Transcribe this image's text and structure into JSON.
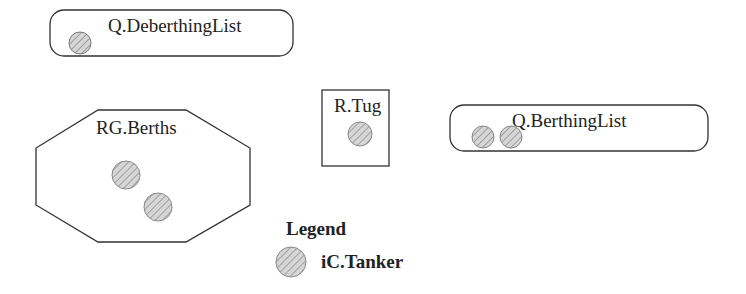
{
  "diagram": {
    "queues": [
      {
        "id": "deberthing",
        "label": "Q.DeberthingList",
        "entity_count": 1
      },
      {
        "id": "berthing",
        "label": "Q.BerthingList",
        "entity_count": 2
      }
    ],
    "resources": [
      {
        "id": "tug",
        "label": "R.Tug",
        "entity_count": 1
      }
    ],
    "resource_groups": [
      {
        "id": "berths",
        "label": "RG.Berths",
        "entity_count": 2
      }
    ],
    "legend": {
      "title": "Legend",
      "items": [
        {
          "label": "iC.Tanker",
          "symbol": "hatched-circle"
        }
      ]
    },
    "colors": {
      "stroke": "#333333",
      "entity_fill": "#d0d0d0",
      "hatch": "#9a9a9a"
    }
  }
}
